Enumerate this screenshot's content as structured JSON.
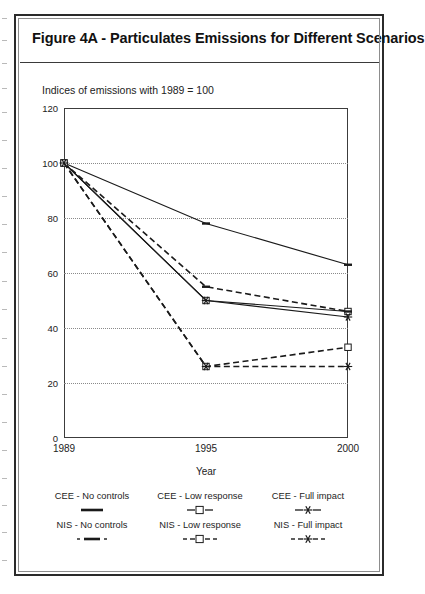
{
  "figure": {
    "title": "Figure 4A - Particulates Emissions for Different Scenarios",
    "subtitle": "Indices of emissions with 1989 = 100"
  },
  "chart_data": {
    "type": "line",
    "title": "Figure 4A - Particulates Emissions for Different Scenarios",
    "subtitle": "Indices of emissions with 1989 = 100",
    "xlabel": "Year",
    "ylabel": "",
    "x": [
      "1989",
      "1995",
      "2000"
    ],
    "x_numeric": [
      1989,
      1995,
      2000
    ],
    "xtick_labels": [
      "1989",
      "1995",
      "2000"
    ],
    "ytick_labels": [
      "0",
      "20",
      "40",
      "60",
      "80",
      "100",
      "120"
    ],
    "ytick_values": [
      0,
      20,
      40,
      60,
      80,
      100,
      120
    ],
    "ylim": [
      0,
      120
    ],
    "grid": "horizontal-dotted",
    "legend_position": "below-plot",
    "series": [
      {
        "name": "CEE - No controls",
        "values": [
          100,
          78,
          63
        ],
        "style": "solid",
        "marker": "dash",
        "color": "#1a1a1a"
      },
      {
        "name": "CEE - Low response",
        "values": [
          100,
          50,
          46
        ],
        "style": "solid",
        "marker": "square",
        "color": "#1a1a1a"
      },
      {
        "name": "CEE - Full impact",
        "values": [
          100,
          50,
          44
        ],
        "style": "solid",
        "marker": "asterisk",
        "color": "#1a1a1a"
      },
      {
        "name": "NIS - No controls",
        "values": [
          100,
          55,
          46
        ],
        "style": "dashed",
        "marker": "dash",
        "color": "#1a1a1a"
      },
      {
        "name": "NIS - Low response",
        "values": [
          100,
          26,
          33
        ],
        "style": "dashed",
        "marker": "square",
        "color": "#1a1a1a"
      },
      {
        "name": "NIS - Full impact",
        "values": [
          100,
          26,
          26
        ],
        "style": "dashed",
        "marker": "asterisk",
        "color": "#1a1a1a"
      }
    ]
  },
  "legend": {
    "entries": [
      {
        "label": "CEE - No controls",
        "style": "solid",
        "marker": "dash"
      },
      {
        "label": "CEE - Low response",
        "style": "solid",
        "marker": "square"
      },
      {
        "label": "CEE - Full impact",
        "style": "solid",
        "marker": "asterisk"
      },
      {
        "label": "NIS - No controls",
        "style": "dashed",
        "marker": "dash"
      },
      {
        "label": "NIS - Low response",
        "style": "dashed",
        "marker": "square"
      },
      {
        "label": "NIS - Full impact",
        "style": "dashed",
        "marker": "asterisk"
      }
    ]
  }
}
